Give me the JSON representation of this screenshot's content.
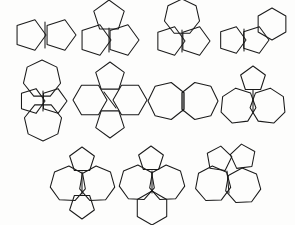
{
  "figure": {
    "background_color": "#fdfdfc",
    "stroke_color": "#1a1a1a",
    "stroke_width": 1.05,
    "canvas": {
      "width": 295,
      "height": 225
    },
    "row_count": 3,
    "structure_count": 11
  },
  "structures": [
    {
      "id": "structure-1",
      "row": 1,
      "column": 1,
      "name": "bicyclic-pentagon-pentagon",
      "ring_sizes": [
        5,
        5
      ],
      "ring_count": 2,
      "center": {
        "x": 45,
        "y": 35
      },
      "rings": [
        {
          "type": "pentagon",
          "sides": 5,
          "radius": 16,
          "cx": 30,
          "cy": 35,
          "rotation": 162
        },
        {
          "type": "pentagon",
          "sides": 5,
          "radius": 16,
          "cx": 60,
          "cy": 35,
          "rotation": 18
        }
      ],
      "shared_edges": [
        {
          "x1": 45,
          "y1": 22,
          "x2": 45,
          "y2": 48
        }
      ]
    },
    {
      "id": "structure-2",
      "row": 1,
      "column": 2,
      "name": "tricyclic-three-pentagons",
      "ring_sizes": [
        5,
        5,
        5
      ],
      "ring_count": 3,
      "center": {
        "x": 108,
        "y": 33
      },
      "rings": [
        {
          "type": "pentagon",
          "sides": 5,
          "radius": 16,
          "cx": 95,
          "cy": 40,
          "rotation": 162
        },
        {
          "type": "pentagon",
          "sides": 5,
          "radius": 16,
          "cx": 123,
          "cy": 40,
          "rotation": 18
        },
        {
          "type": "pentagon",
          "sides": 5,
          "radius": 16,
          "cx": 109,
          "cy": 16,
          "rotation": 0
        }
      ],
      "shared_edges": [
        {
          "x1": 109,
          "y1": 28,
          "x2": 109,
          "y2": 52
        }
      ]
    },
    {
      "id": "structure-3",
      "row": 1,
      "column": 3,
      "name": "heptagon-over-two-pentagons",
      "ring_sizes": [
        7,
        5,
        5
      ],
      "ring_count": 3,
      "center": {
        "x": 182,
        "y": 32
      },
      "rings": [
        {
          "type": "heptagon",
          "sides": 7,
          "radius": 18,
          "cx": 182,
          "cy": 17,
          "rotation": 0
        },
        {
          "type": "pentagon",
          "sides": 5,
          "radius": 15,
          "cx": 170,
          "cy": 41,
          "rotation": 162
        },
        {
          "type": "pentagon",
          "sides": 5,
          "radius": 15,
          "cx": 195,
          "cy": 41,
          "rotation": 18
        }
      ],
      "shared_edges": [
        {
          "x1": 182,
          "y1": 30,
          "x2": 182,
          "y2": 52
        }
      ]
    },
    {
      "id": "structure-4",
      "row": 1,
      "column": 4,
      "name": "two-pentagons-with-hexagon",
      "ring_sizes": [
        5,
        5,
        6
      ],
      "ring_count": 3,
      "center": {
        "x": 252,
        "y": 32
      },
      "rings": [
        {
          "type": "pentagon",
          "sides": 5,
          "radius": 14,
          "cx": 232,
          "cy": 40,
          "rotation": 162
        },
        {
          "type": "pentagon",
          "sides": 5,
          "radius": 14,
          "cx": 255,
          "cy": 40,
          "rotation": 18
        },
        {
          "type": "hexagon",
          "sides": 6,
          "radius": 16,
          "cx": 272,
          "cy": 24,
          "rotation": 0
        }
      ],
      "shared_edges": [
        {
          "x1": 244,
          "y1": 29,
          "x2": 244,
          "y2": 51
        }
      ]
    },
    {
      "id": "structure-5",
      "row": 2,
      "column": 1,
      "name": "two-heptagons-two-pentagons-vertical",
      "ring_sizes": [
        7,
        5,
        5,
        7
      ],
      "ring_count": 4,
      "center": {
        "x": 43,
        "y": 100
      },
      "rings": [
        {
          "type": "heptagon",
          "sides": 7,
          "radius": 19,
          "cx": 42,
          "cy": 79,
          "rotation": 0
        },
        {
          "type": "pentagon",
          "sides": 5,
          "radius": 13,
          "cx": 32,
          "cy": 101,
          "rotation": 162
        },
        {
          "type": "pentagon",
          "sides": 5,
          "radius": 13,
          "cx": 54,
          "cy": 101,
          "rotation": 18
        },
        {
          "type": "heptagon",
          "sides": 7,
          "radius": 19,
          "cx": 43,
          "cy": 122,
          "rotation": 180
        }
      ],
      "shared_edges": [
        {
          "x1": 43,
          "y1": 91,
          "x2": 43,
          "y2": 111
        }
      ]
    },
    {
      "id": "structure-6",
      "row": 2,
      "column": 2,
      "name": "two-pentagons-two-hexagons-cross",
      "ring_sizes": [
        5,
        6,
        6,
        5
      ],
      "ring_count": 4,
      "center": {
        "x": 110,
        "y": 100
      },
      "rings": [
        {
          "type": "pentagon",
          "sides": 5,
          "radius": 15,
          "cx": 110,
          "cy": 77,
          "rotation": 0
        },
        {
          "type": "hexagon",
          "sides": 6,
          "radius": 17,
          "cx": 90,
          "cy": 100,
          "rotation": 90
        },
        {
          "type": "hexagon",
          "sides": 6,
          "radius": 17,
          "cx": 130,
          "cy": 100,
          "rotation": 90
        },
        {
          "type": "pentagon",
          "sides": 5,
          "radius": 15,
          "cx": 110,
          "cy": 123,
          "rotation": 180
        }
      ],
      "shared_edges": [
        {
          "x1": 104,
          "y1": 92,
          "x2": 116,
          "y2": 108
        }
      ]
    },
    {
      "id": "structure-7",
      "row": 2,
      "column": 3,
      "name": "two-fused-heptagons",
      "ring_sizes": [
        7,
        7
      ],
      "ring_count": 2,
      "center": {
        "x": 183,
        "y": 101
      },
      "rings": [
        {
          "type": "heptagon",
          "sides": 7,
          "radius": 19,
          "cx": 167,
          "cy": 101,
          "rotation": 270
        },
        {
          "type": "heptagon",
          "sides": 7,
          "radius": 19,
          "cx": 199,
          "cy": 101,
          "rotation": 90
        }
      ],
      "shared_edges": [
        {
          "x1": 183,
          "y1": 92,
          "x2": 183,
          "y2": 111
        }
      ]
    },
    {
      "id": "structure-8",
      "row": 2,
      "column": 4,
      "name": "two-heptagons-with-top-pentagon",
      "ring_sizes": [
        5,
        7,
        7
      ],
      "ring_count": 3,
      "center": {
        "x": 253,
        "y": 100
      },
      "rings": [
        {
          "type": "pentagon",
          "sides": 5,
          "radius": 13,
          "cx": 253,
          "cy": 79,
          "rotation": 0
        },
        {
          "type": "heptagon",
          "sides": 7,
          "radius": 18,
          "cx": 238,
          "cy": 106,
          "rotation": 250
        },
        {
          "type": "heptagon",
          "sides": 7,
          "radius": 18,
          "cx": 268,
          "cy": 106,
          "rotation": 110
        }
      ],
      "shared_edges": [
        {
          "x1": 253,
          "y1": 90,
          "x2": 253,
          "y2": 112
        }
      ]
    },
    {
      "id": "structure-9",
      "row": 3,
      "column": 1,
      "name": "two-heptagons-two-pentagons-horizontal",
      "ring_sizes": [
        5,
        7,
        7,
        5
      ],
      "ring_count": 4,
      "center": {
        "x": 82,
        "y": 183
      },
      "rings": [
        {
          "type": "pentagon",
          "sides": 5,
          "radius": 13,
          "cx": 82,
          "cy": 160,
          "rotation": 0
        },
        {
          "type": "heptagon",
          "sides": 7,
          "radius": 18,
          "cx": 68,
          "cy": 184,
          "rotation": 260
        },
        {
          "type": "heptagon",
          "sides": 7,
          "radius": 18,
          "cx": 97,
          "cy": 184,
          "rotation": 100
        },
        {
          "type": "pentagon",
          "sides": 5,
          "radius": 13,
          "cx": 82,
          "cy": 206,
          "rotation": 180
        }
      ],
      "shared_edges": [
        {
          "x1": 82,
          "y1": 172,
          "x2": 82,
          "y2": 194
        }
      ]
    },
    {
      "id": "structure-10",
      "row": 3,
      "column": 2,
      "name": "two-heptagons-pentagon-top-hexagon-bottom",
      "ring_sizes": [
        5,
        7,
        7,
        6
      ],
      "ring_count": 4,
      "center": {
        "x": 152,
        "y": 185
      },
      "rings": [
        {
          "type": "pentagon",
          "sides": 5,
          "radius": 13,
          "cx": 151,
          "cy": 159,
          "rotation": 0
        },
        {
          "type": "heptagon",
          "sides": 7,
          "radius": 18,
          "cx": 137,
          "cy": 183,
          "rotation": 260
        },
        {
          "type": "heptagon",
          "sides": 7,
          "radius": 18,
          "cx": 167,
          "cy": 183,
          "rotation": 100
        },
        {
          "type": "hexagon",
          "sides": 6,
          "radius": 17,
          "cx": 152,
          "cy": 208,
          "rotation": 0
        }
      ],
      "shared_edges": [
        {
          "x1": 152,
          "y1": 171,
          "x2": 152,
          "y2": 193
        }
      ]
    },
    {
      "id": "structure-11",
      "row": 3,
      "column": 3,
      "name": "two-heptagons-two-pentagons-angled",
      "ring_sizes": [
        5,
        5,
        7,
        7
      ],
      "ring_count": 4,
      "center": {
        "x": 228,
        "y": 182
      },
      "rings": [
        {
          "type": "pentagon",
          "sides": 5,
          "radius": 13,
          "cx": 219,
          "cy": 159,
          "rotation": 8
        },
        {
          "type": "pentagon",
          "sides": 5,
          "radius": 13,
          "cx": 243,
          "cy": 157,
          "rotation": 65
        },
        {
          "type": "heptagon",
          "sides": 7,
          "radius": 18,
          "cx": 213,
          "cy": 184,
          "rotation": 255
        },
        {
          "type": "heptagon",
          "sides": 7,
          "radius": 18,
          "cx": 243,
          "cy": 186,
          "rotation": 100
        }
      ],
      "shared_edges": [
        {
          "x1": 227,
          "y1": 171,
          "x2": 229,
          "y2": 193
        }
      ]
    }
  ]
}
